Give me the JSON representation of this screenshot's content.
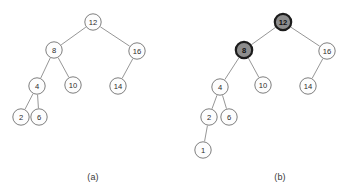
{
  "figure": {
    "background_color": "#ffffff",
    "node_fill": "#fdfdfd",
    "node_stroke": "#6f6f6f",
    "shaded_node_fill": "#8d8d8d",
    "shaded_node_stroke": "#1c1c1c",
    "edge_color": "#8a8a8a",
    "node_radius": 8.2,
    "shaded_node_radius": 8.2
  },
  "panels": [
    {
      "id": "panel-a",
      "caption": "(a)",
      "caption_x": 93,
      "caption_y": 177,
      "nodes": [
        {
          "id": "a-12",
          "label": "12",
          "x": 93,
          "y": 22,
          "shaded": false
        },
        {
          "id": "a-8",
          "label": "8",
          "x": 54,
          "y": 50,
          "shaded": false
        },
        {
          "id": "a-16",
          "label": "16",
          "x": 137,
          "y": 51,
          "shaded": false
        },
        {
          "id": "a-4",
          "label": "4",
          "x": 37,
          "y": 86,
          "shaded": false
        },
        {
          "id": "a-10",
          "label": "10",
          "x": 73,
          "y": 85,
          "shaded": false
        },
        {
          "id": "a-14",
          "label": "14",
          "x": 118,
          "y": 86,
          "shaded": false
        },
        {
          "id": "a-2",
          "label": "2",
          "x": 21,
          "y": 117,
          "shaded": false
        },
        {
          "id": "a-6",
          "label": "6",
          "x": 39,
          "y": 117,
          "shaded": false
        }
      ],
      "edges": [
        {
          "from": "a-12",
          "to": "a-8"
        },
        {
          "from": "a-12",
          "to": "a-16"
        },
        {
          "from": "a-8",
          "to": "a-4"
        },
        {
          "from": "a-8",
          "to": "a-10"
        },
        {
          "from": "a-16",
          "to": "a-14"
        },
        {
          "from": "a-4",
          "to": "a-2"
        },
        {
          "from": "a-4",
          "to": "a-6"
        }
      ]
    },
    {
      "id": "panel-b",
      "caption": "(b)",
      "caption_x": 280,
      "caption_y": 177,
      "nodes": [
        {
          "id": "b-12",
          "label": "12",
          "x": 283,
          "y": 22,
          "shaded": true
        },
        {
          "id": "b-8",
          "label": "8",
          "x": 244,
          "y": 50,
          "shaded": true
        },
        {
          "id": "b-16",
          "label": "16",
          "x": 327,
          "y": 51,
          "shaded": false
        },
        {
          "id": "b-4",
          "label": "4",
          "x": 220,
          "y": 87,
          "shaded": false
        },
        {
          "id": "b-10",
          "label": "10",
          "x": 263,
          "y": 85,
          "shaded": false
        },
        {
          "id": "b-14",
          "label": "14",
          "x": 308,
          "y": 86,
          "shaded": false
        },
        {
          "id": "b-2",
          "label": "2",
          "x": 209,
          "y": 117,
          "shaded": false
        },
        {
          "id": "b-6",
          "label": "6",
          "x": 229,
          "y": 117,
          "shaded": false
        },
        {
          "id": "b-1",
          "label": "1",
          "x": 203,
          "y": 150,
          "shaded": false
        }
      ],
      "edges": [
        {
          "from": "b-12",
          "to": "b-8"
        },
        {
          "from": "b-12",
          "to": "b-16"
        },
        {
          "from": "b-8",
          "to": "b-4"
        },
        {
          "from": "b-8",
          "to": "b-10"
        },
        {
          "from": "b-16",
          "to": "b-14"
        },
        {
          "from": "b-4",
          "to": "b-2"
        },
        {
          "from": "b-4",
          "to": "b-6"
        },
        {
          "from": "b-2",
          "to": "b-1"
        }
      ]
    }
  ]
}
